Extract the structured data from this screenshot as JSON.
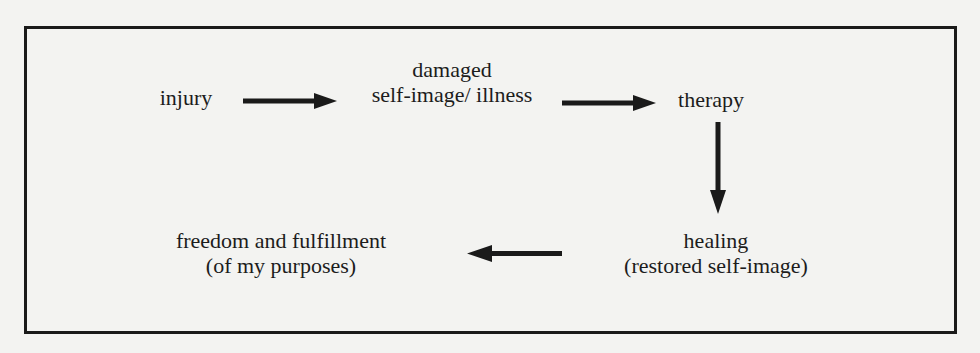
{
  "diagram": {
    "type": "flow",
    "nodes": [
      {
        "id": "injury",
        "lines": [
          "injury"
        ]
      },
      {
        "id": "damaged",
        "lines": [
          "damaged",
          "self-image/ illness"
        ]
      },
      {
        "id": "therapy",
        "lines": [
          "therapy"
        ]
      },
      {
        "id": "healing",
        "lines": [
          "healing",
          "(restored self-image)"
        ]
      },
      {
        "id": "freedom",
        "lines": [
          "freedom and fulfillment",
          "(of my purposes)"
        ]
      }
    ],
    "edges": [
      {
        "from": "injury",
        "to": "damaged"
      },
      {
        "from": "damaged",
        "to": "therapy"
      },
      {
        "from": "therapy",
        "to": "healing"
      },
      {
        "from": "healing",
        "to": "freedom"
      }
    ]
  },
  "colors": {
    "ink": "#1a1a1a",
    "paper": "#f3f3f1"
  }
}
